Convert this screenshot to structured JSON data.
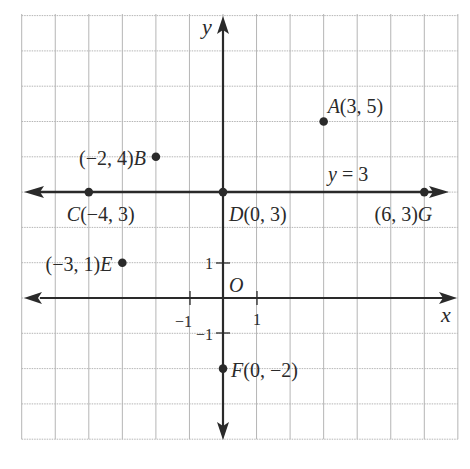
{
  "diagram": {
    "type": "coordinate-plane",
    "axes": {
      "x_label": "x",
      "y_label": "y",
      "origin_label": "O",
      "x_range": [
        -6,
        7
      ],
      "y_range": [
        -4,
        8
      ],
      "ticks": {
        "x_pos": "1",
        "x_neg": "−1",
        "y_pos": "1",
        "y_neg": "−1"
      }
    },
    "line": {
      "label": "y = 3",
      "y": 3
    },
    "points": [
      {
        "name": "A",
        "x": 3,
        "y": 5,
        "label": "A(3, 5)",
        "anchor": "right"
      },
      {
        "name": "B",
        "x": -2,
        "y": 4,
        "label": "(−2, 4)B",
        "anchor": "left"
      },
      {
        "name": "C",
        "x": -4,
        "y": 3,
        "label": "C(−4, 3)",
        "anchor": "below"
      },
      {
        "name": "D",
        "x": 0,
        "y": 3,
        "label": "D(0, 3)",
        "anchor": "below-right"
      },
      {
        "name": "E",
        "x": -3,
        "y": 1,
        "label": "(−3, 1)E",
        "anchor": "left"
      },
      {
        "name": "F",
        "x": 0,
        "y": -2,
        "label": "F(0, −2)",
        "anchor": "right"
      },
      {
        "name": "G",
        "x": 6,
        "y": 3,
        "label": "(6, 3)G",
        "anchor": "below-left"
      }
    ],
    "colors": {
      "grid": "#b5b5b5",
      "axis": "#2a2a2a",
      "text": "#2a2a2a",
      "background": "#ffffff"
    }
  }
}
